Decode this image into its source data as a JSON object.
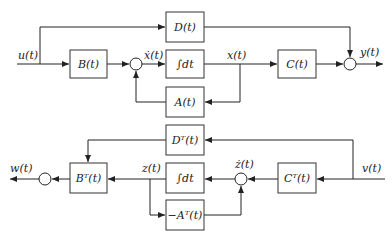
{
  "diagram": {
    "type": "block-diagram",
    "primal_system": {
      "input_label": "u(t)",
      "output_label": "y(t)",
      "state_label": "x(t)",
      "state_derivative_label": "ẋ(t)",
      "blocks": {
        "B": "B(t)",
        "integrator": "∫dt",
        "A": "A(t)",
        "C": "C(t)",
        "D": "D(t)"
      }
    },
    "adjoint_system": {
      "input_label": "v(t)",
      "output_label": "w(t)",
      "state_label": "z(t)",
      "state_derivative_label": "ż(t)",
      "blocks": {
        "BT": "Bᵀ(t)",
        "integrator": "∫dt",
        "negAT": "−Aᵀ(t)",
        "CT": "Cᵀ(t)",
        "DT": "Dᵀ(t)"
      }
    },
    "colors": {
      "line": "#222222",
      "background": "#ffffff"
    }
  }
}
